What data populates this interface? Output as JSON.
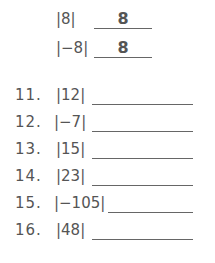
{
  "examples": [
    {
      "expression": "|8|",
      "answer": "8"
    },
    {
      "expression": "|−8|",
      "answer": "8"
    }
  ],
  "problems": [
    {
      "number": "11.",
      "expression": "|12|",
      "answer": ""
    },
    {
      "number": "12.",
      "expression": "|−7|",
      "answer": ""
    },
    {
      "number": "13.",
      "expression": "|15|",
      "answer": ""
    },
    {
      "number": "14.",
      "expression": "|23|",
      "answer": ""
    },
    {
      "number": "15.",
      "expression": "|−105|",
      "answer": ""
    },
    {
      "number": "16.",
      "expression": "|48|",
      "answer": ""
    }
  ]
}
